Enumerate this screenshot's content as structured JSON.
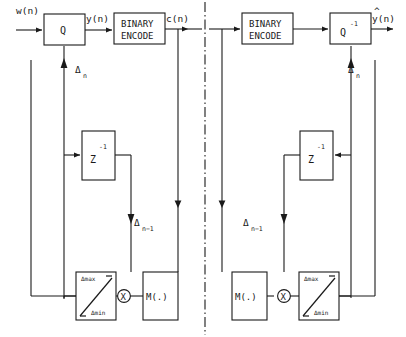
{
  "diagram": {
    "encoder": {
      "input_label": "w(n)",
      "quantizer_label": "Q",
      "quantizer_output_label": "y(n)",
      "coder_line1": "BINARY",
      "coder_line2": "ENCODE",
      "coder_output_label": "c(n)",
      "step_label": "Δ",
      "step_sub": "n",
      "delay_label": "Z",
      "delay_sup": "-1",
      "delayed_step_label": "Δ",
      "delayed_step_sub": "n−1",
      "limiter_max": "Δmax",
      "limiter_min": "Δmin",
      "multiplier_label": "X",
      "multiplier_func_label": "M(.)"
    },
    "decoder": {
      "coder_line1": "BINARY",
      "coder_line2": "ENCODE",
      "dequantizer_label": "Q",
      "dequantizer_sup": "-1",
      "output_label": "y(n)",
      "output_hat": "^",
      "step_label": "Δ",
      "step_sub": "n",
      "delay_label": "Z",
      "delay_sup": "-1",
      "delayed_step_label": "Δ",
      "delayed_step_sub": "n−1",
      "limiter_max": "Δmax",
      "limiter_min": "Δmin",
      "multiplier_label": "X",
      "multiplier_func_label": "M(.)"
    },
    "divider": "dash-dot vertical separator",
    "colors": {
      "ink": "#1a1a1a",
      "paper": "#ffffff"
    }
  }
}
